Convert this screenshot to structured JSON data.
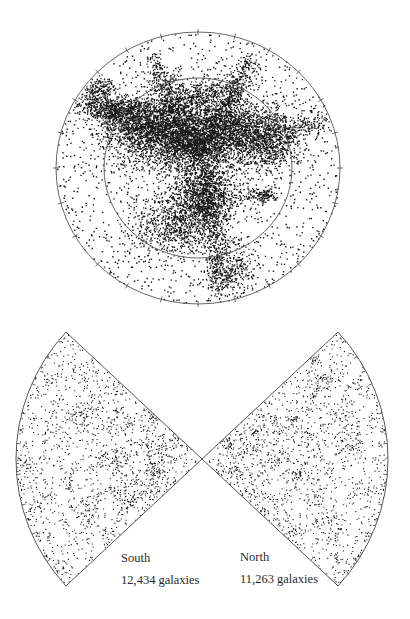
{
  "chart_data": [
    {
      "type": "scatter",
      "subtype": "polar-sky-map",
      "title": "",
      "description": "All-sky polar projection of galaxy positions, dense filamentary structure concentrated toward center",
      "center": [
        198,
        168
      ],
      "outer_radius": [
        142,
        136
      ],
      "inner_radius": [
        94,
        90
      ],
      "rings": 2,
      "tick_marks_on_outer_ring": true,
      "grid": false,
      "legend": null,
      "point_color": "#1a1a1a"
    },
    {
      "type": "scatter",
      "subtype": "redshift-wedge-diagram",
      "title": "",
      "apex": [
        202,
        459
      ],
      "radius": 186,
      "half_angle_deg": 43,
      "tick_marks_on_arc": true,
      "grid": false,
      "series": [
        {
          "name": "South",
          "count": 12434,
          "count_label": "12,434 galaxies",
          "direction": "left"
        },
        {
          "name": "North",
          "count": 11263,
          "count_label": "11,263 galaxies",
          "direction": "right"
        }
      ]
    }
  ],
  "labels": {
    "south": {
      "title": "South",
      "count": "12,434 galaxies"
    },
    "north": {
      "title": "North",
      "count": "11,263 galaxies"
    }
  },
  "colors": {
    "background": "#ffffff",
    "outline": "#555555",
    "points": "#1a1a1a"
  }
}
